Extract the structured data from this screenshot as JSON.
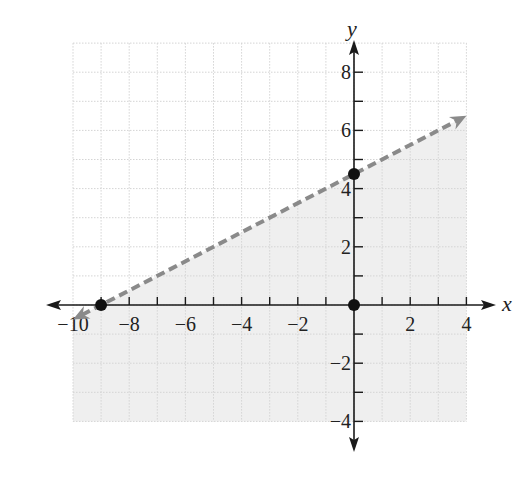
{
  "chart_data": {
    "type": "line",
    "title": "",
    "xlabel": "x",
    "ylabel": "y",
    "xlim": [
      -10,
      4
    ],
    "ylim": [
      -4,
      9
    ],
    "grid": true,
    "x_ticks": [
      -10,
      -8,
      -6,
      -4,
      -2,
      2,
      4
    ],
    "x_tick_labels": [
      "−10",
      "−8",
      "−6",
      "−4",
      "−2",
      "2",
      "4"
    ],
    "y_ticks": [
      -4,
      -2,
      2,
      4,
      6,
      8
    ],
    "y_tick_labels": [
      "−4",
      "−2",
      "2",
      "4",
      "6",
      "8"
    ],
    "boundary_line": {
      "equation": "y = 0.5x + 4.5",
      "style": "dashed",
      "color": "#8a8a8a",
      "from": [
        -10,
        -0.5
      ],
      "to": [
        4,
        6.5
      ]
    },
    "shaded_region": "below the line (y < 0.5x + 4.5)",
    "shade_color": "#efefef",
    "points": [
      {
        "x": -9,
        "y": 0,
        "label": "x-intercept"
      },
      {
        "x": 0,
        "y": 4.5,
        "label": "y-intercept"
      },
      {
        "x": 0,
        "y": 0,
        "label": "origin"
      }
    ]
  },
  "axes": {
    "x_name": "x",
    "y_name": "y"
  }
}
